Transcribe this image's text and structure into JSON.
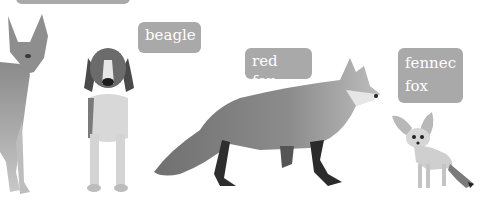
{
  "labels": {
    "top_cut": "",
    "beagle": "beagle",
    "red_fox": "red fox",
    "fennec_fox_line1": "fennec",
    "fennec_fox_line2": "fox"
  },
  "colors": {
    "label_bg": "#a9a9a9",
    "label_text": "#ffffff",
    "background": "#ffffff"
  }
}
